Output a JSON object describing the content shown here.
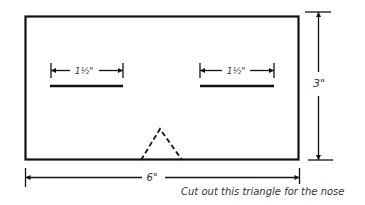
{
  "diagram": {
    "stroke_color": "#111111",
    "rectangle": {
      "label": "mask-outline"
    },
    "eye_slits": [
      {
        "label": "left-eye-slit",
        "dimension": "1½\""
      },
      {
        "label": "right-eye-slit",
        "dimension": "1½\""
      }
    ],
    "width_dimension": "6\"",
    "height_dimension": "3\"",
    "nose": {
      "label": "nose-cutout-triangle"
    },
    "caption": "Cut out this triangle for the nose"
  }
}
